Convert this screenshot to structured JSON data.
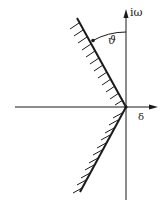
{
  "diagram": {
    "type": "complex-plane stability sector",
    "axes": {
      "vertical_label": "iω",
      "horizontal_label": "δ"
    },
    "angle_label": "ϑ",
    "colors": {
      "ink": "#1a1a1a",
      "background": "#ffffff"
    },
    "elements": [
      {
        "name": "vertical-axis",
        "description": "imaginary axis with arrow pointing up"
      },
      {
        "name": "horizontal-axis",
        "description": "real axis with arrow pointing right"
      },
      {
        "name": "upper-boundary-line",
        "description": "hatched ray from origin into second quadrant"
      },
      {
        "name": "lower-boundary-line",
        "description": "hatched ray from origin into third quadrant"
      },
      {
        "name": "angle-arc",
        "description": "arc marking angle between imaginary axis and upper boundary"
      }
    ]
  }
}
